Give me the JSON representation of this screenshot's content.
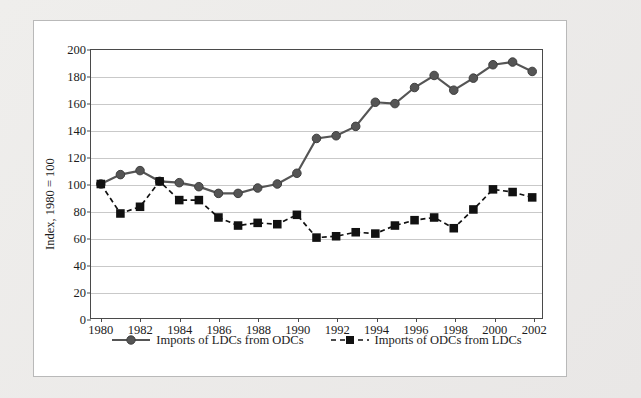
{
  "chart_data": {
    "type": "line",
    "title": "",
    "xlabel": "",
    "ylabel": "Index, 1980 = 100",
    "xlim": [
      1979.5,
      2002.5
    ],
    "ylim": [
      0,
      200
    ],
    "ytick_step": 20,
    "yticks": [
      0,
      20,
      40,
      60,
      80,
      100,
      120,
      140,
      160,
      180,
      200
    ],
    "xticks": [
      1980,
      1982,
      1984,
      1986,
      1988,
      1990,
      1992,
      1994,
      1996,
      1998,
      2000,
      2002
    ],
    "x": [
      1980,
      1981,
      1982,
      1983,
      1984,
      1985,
      1986,
      1987,
      1988,
      1989,
      1990,
      1991,
      1992,
      1993,
      1994,
      1995,
      1996,
      1997,
      1998,
      1999,
      2000,
      2001,
      2002
    ],
    "grid": "horizontal",
    "legend_position": "bottom-center",
    "series": [
      {
        "name": "Imports of LDCs from ODCs",
        "marker": "circle",
        "linestyle": "solid",
        "color": "#555555",
        "values": [
          100,
          107,
          110,
          102,
          101,
          98,
          93,
          93,
          97,
          100,
          108,
          134,
          136,
          143,
          161,
          160,
          172,
          181,
          170,
          179,
          189,
          191,
          184
        ]
      },
      {
        "name": "Imports of ODCs from LDCs",
        "marker": "square",
        "linestyle": "dashed",
        "color": "#111111",
        "values": [
          100,
          78,
          83,
          102,
          88,
          88,
          75,
          69,
          71,
          70,
          77,
          60,
          61,
          64,
          63,
          69,
          73,
          75,
          67,
          81,
          96,
          94,
          90
        ]
      }
    ]
  },
  "legend": {
    "entries": [
      {
        "label": "Imports of LDCs from ODCs",
        "marker": "circle-solid-line-marker"
      },
      {
        "label": "Imports of ODCs from LDCs",
        "marker": "square-dashed-line-marker"
      }
    ]
  },
  "colors": {
    "page_background": "#ece9e8",
    "panel_background": "#ffffff",
    "panel_border": "#b9b9b9",
    "axis": "#4a4a4a",
    "gridline": "#c9c9c9",
    "series_circle": "#555555",
    "series_square": "#111111",
    "text": "#1c1c1c"
  }
}
